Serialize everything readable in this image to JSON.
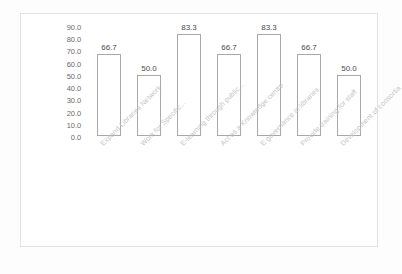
{
  "figure": {
    "background_color": "#ffffff",
    "frame_color": "#e2e2e2"
  },
  "chart_data": {
    "type": "bar",
    "title": "",
    "subtitle": "",
    "xlabel": "",
    "ylabel": "",
    "categories": [
      "Expand Libraries Network",
      "Work for Specific...",
      "E-learning through public...",
      "Act as a Knowledge centre",
      "E governance in libraries",
      "Provide training for staff",
      "Development of consortia"
    ],
    "values": [
      66.7,
      50.0,
      83.3,
      66.7,
      83.3,
      66.7,
      50.0
    ],
    "data_labels": [
      "66.7",
      "50.0",
      "83.3",
      "66.7",
      "83.3",
      "66.7",
      "50.0"
    ],
    "ylim": [
      0.0,
      90.0
    ],
    "ytick_labels": [
      "90.0",
      "80.0",
      "70.0",
      "60.0",
      "50.0",
      "40.0",
      "30.0",
      "20.0",
      "10.0",
      "0.0"
    ],
    "ytick_values": [
      90.0,
      80.0,
      70.0,
      60.0,
      50.0,
      40.0,
      30.0,
      20.0,
      10.0,
      0.0
    ],
    "grid": false,
    "legend": false,
    "legend_position": "none",
    "bar_fill_color": "#ffffff",
    "bar_edge_color": "#a9a9a9",
    "label_rotation": -45
  }
}
